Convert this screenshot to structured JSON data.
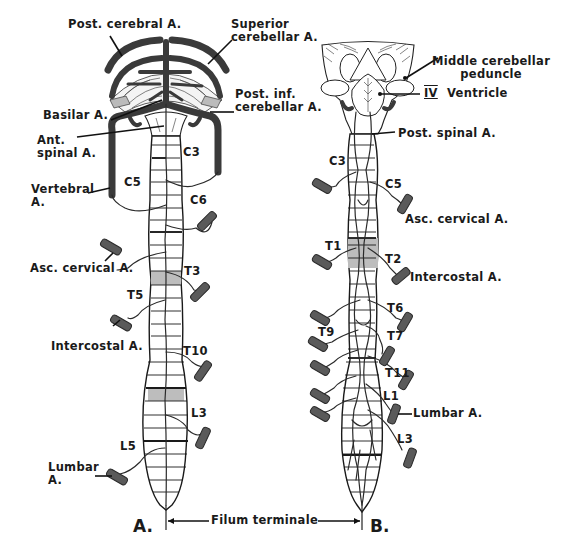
{
  "figure": {
    "panels": [
      {
        "id": "A",
        "label": "A.",
        "view": "anterior"
      },
      {
        "id": "B",
        "label": "B.",
        "view": "posterior"
      }
    ],
    "colors": {
      "vessel": "#4a4a4a",
      "outline": "#1a1a1a",
      "shading": "#bdbdbd",
      "background": "#ffffff"
    }
  },
  "panel_a": {
    "labels": {
      "post_cerebral": "Post. cerebral A.",
      "superior_cerebellar": "Superior\ncerebellar A.",
      "basilar": "Basilar A.",
      "post_inf_cerebellar": "Post. inf.\ncerebellar A.",
      "ant_spinal": "Ant.\nspinal A.",
      "vertebral": "Vertebral\nA.",
      "asc_cervical": "Asc. cervical A.",
      "intercostal": "Intercostal A.",
      "lumbar": "Lumbar\nA."
    },
    "segments": [
      "C3",
      "C5",
      "C6",
      "T3",
      "T5",
      "T10",
      "L3",
      "L5"
    ]
  },
  "panel_b": {
    "labels": {
      "middle_cerebellar_peduncle": "Middle cerebellar\npeduncle",
      "iv_numeral": "IV",
      "ventricle": "Ventricle",
      "post_spinal": "Post. spinal A.",
      "asc_cervical": "Asc. cervical A.",
      "intercostal": "Intercostal A.",
      "lumbar": "Lumbar A."
    },
    "segments": [
      "C3",
      "C5",
      "T1",
      "T2",
      "T6",
      "T9",
      "T7",
      "T11",
      "L1",
      "L3"
    ]
  },
  "shared": {
    "filum_terminale": "Filum terminale"
  }
}
